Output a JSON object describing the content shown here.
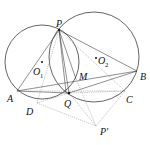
{
  "diagram": {
    "type": "geometry-figure",
    "circles": [
      {
        "name": "circle-O1",
        "center_label": "O",
        "center_sub": "1"
      },
      {
        "name": "circle-O2",
        "center_label": "O",
        "center_sub": "2"
      }
    ],
    "points": {
      "P": "P",
      "A": "A",
      "B": "B",
      "Q": "Q",
      "M": "M",
      "C": "C",
      "D": "D",
      "P_prime": "P'"
    },
    "labels": {
      "P": "P",
      "A": "A",
      "B": "B",
      "Q": "Q",
      "M": "M",
      "C": "C",
      "D": "D",
      "P_prime": "P′",
      "O1": "O",
      "O1_sub": "1",
      "O2": "O",
      "O2_sub": "2"
    },
    "segments_solid": [
      "PA",
      "PB",
      "AB",
      "PQ",
      "PM",
      "AQ",
      "QB"
    ],
    "segments_dashed": [
      "AC",
      "QD",
      "QP'",
      "DP'",
      "CP'",
      "PD",
      "PC"
    ]
  }
}
